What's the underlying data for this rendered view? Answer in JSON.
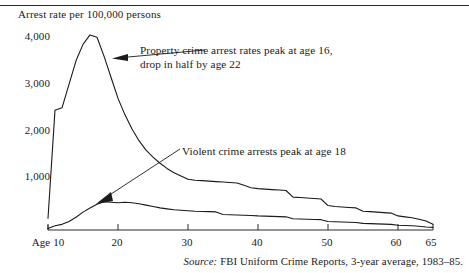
{
  "figure": {
    "y_axis_title": "Arrest rate per 100,000 persons",
    "source_label": "Source:",
    "source_text": "FBI Uniform Crime Reports, 3-year average, 1983–85."
  },
  "annotations": {
    "property": {
      "line1": "Property crime arrest rates peak at age 16,",
      "line2": "drop in half by age 22"
    },
    "violent": {
      "line1": "Violent crime arrests peak at age 18"
    }
  },
  "axis": {
    "y_ticks": [
      "1,000",
      "2,000",
      "3,000",
      "4,000"
    ],
    "x_ticks": [
      "Age 10",
      "20",
      "30",
      "40",
      "50",
      "60",
      "65"
    ]
  },
  "chart_data": {
    "type": "line",
    "title": "",
    "subtitle": "",
    "xlabel": "Age",
    "ylabel": "Arrest rate per 100,000 persons",
    "xlim": [
      10,
      65
    ],
    "ylim": [
      0,
      4300
    ],
    "grid": false,
    "legend": "none",
    "x_tick_values": [
      10,
      20,
      30,
      40,
      50,
      60,
      65
    ],
    "x_tick_labels": [
      "Age 10",
      "20",
      "30",
      "40",
      "50",
      "60",
      "65"
    ],
    "y_tick_values": [
      1000,
      2000,
      3000,
      4000
    ],
    "y_tick_labels": [
      "1,000",
      "2,000",
      "3,000",
      "4,000"
    ],
    "x": [
      10,
      11,
      12,
      13,
      14,
      15,
      16,
      17,
      18,
      19,
      20,
      21,
      22,
      23,
      24,
      25,
      26,
      27,
      28,
      29,
      30,
      31,
      32,
      33,
      34,
      35,
      36,
      37,
      38,
      39,
      40,
      41,
      42,
      43,
      44,
      45,
      46,
      47,
      48,
      49,
      50,
      51,
      52,
      53,
      54,
      55,
      56,
      57,
      58,
      59,
      60,
      61,
      62,
      63,
      64,
      65
    ],
    "series": [
      {
        "name": "Property crime arrest rate",
        "annotation": "Property crime arrest rates peak at age 16, drop in half by age 22",
        "peak_age": 16,
        "peak_value": 4150,
        "values": [
          250,
          2550,
          2600,
          3100,
          3600,
          3950,
          4150,
          4100,
          3700,
          3250,
          2800,
          2450,
          2150,
          1900,
          1700,
          1550,
          1420,
          1310,
          1220,
          1150,
          1080,
          1060,
          1050,
          1040,
          1030,
          1020,
          1010,
          1000,
          950,
          900,
          880,
          870,
          860,
          850,
          840,
          700,
          690,
          680,
          670,
          660,
          520,
          500,
          490,
          480,
          470,
          400,
          390,
          380,
          370,
          360,
          300,
          280,
          260,
          230,
          190,
          120
        ]
      },
      {
        "name": "Violent crime arrest rate",
        "annotation": "Violent crime arrests peak at age 18",
        "peak_age": 18,
        "peak_value": 600,
        "values": [
          30,
          90,
          120,
          180,
          270,
          380,
          470,
          550,
          600,
          590,
          580,
          590,
          580,
          560,
          530,
          500,
          470,
          450,
          430,
          420,
          410,
          400,
          395,
          390,
          385,
          330,
          325,
          320,
          315,
          310,
          300,
          295,
          290,
          285,
          280,
          240,
          235,
          230,
          225,
          220,
          180,
          175,
          170,
          165,
          160,
          140,
          135,
          130,
          125,
          120,
          100,
          95,
          90,
          80,
          65,
          55
        ]
      }
    ]
  }
}
